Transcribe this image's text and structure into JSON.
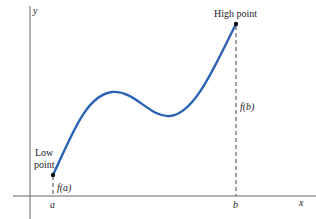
{
  "diagram": {
    "axes": {
      "x_label": "x",
      "y_label": "y"
    },
    "points": {
      "low": {
        "label_line1": "Low",
        "label_line2": "point",
        "value_label": "f(a)",
        "x_label": "a"
      },
      "high": {
        "label": "High point",
        "value_label": "f(b)",
        "x_label": "b"
      }
    },
    "colors": {
      "curve": "#2a62b4",
      "axis": "#555555",
      "dash": "#444444",
      "point": "#111111"
    }
  }
}
